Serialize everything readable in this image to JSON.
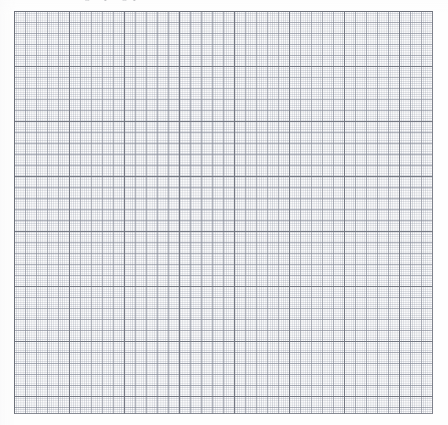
{
  "page": {
    "kind": "scanned-graph-paper",
    "background_color": "#fefefe",
    "width_px": 448,
    "height_px": 425
  },
  "header": {
    "text": "o  r     or",
    "note": "partially cropped text along the very top edge, largely illegible",
    "color": "#8e9096"
  },
  "grid": {
    "origin_x_px": 14,
    "origin_y_px": 11,
    "width_px": 419,
    "height_px": 403,
    "major_spacing_px": 55,
    "medium_spacing_px": 11,
    "fine_spacing_px": 2.2,
    "major_columns": 8,
    "major_rows": 7,
    "subdivisions_per_major": 5,
    "fine_per_medium": 5,
    "major_line_color": "#6c707a",
    "medium_line_color": "#878c98",
    "fine_line_color": "#969caa",
    "paper_color": "#fdfdfd"
  },
  "chart_data": {
    "type": "table",
    "title": "",
    "xlabel": "",
    "ylabel": "",
    "categories": [],
    "values": [],
    "note": "Blank graph paper — no plotted data, curves, markers, axis numbers or legend are present."
  }
}
